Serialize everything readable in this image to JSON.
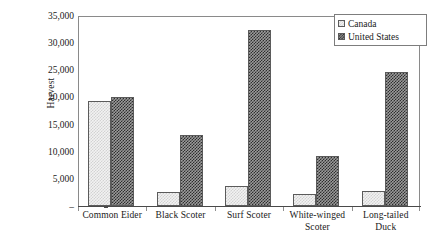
{
  "chart_data": {
    "type": "bar",
    "title": "",
    "xlabel": "",
    "ylabel": "Harvest",
    "ylim": [
      0,
      35000
    ],
    "ytick_values": [
      0,
      5000,
      10000,
      15000,
      20000,
      25000,
      30000,
      35000
    ],
    "ytick_labels": [
      "–",
      "5,000",
      "10,000",
      "15,000",
      "20,000",
      "25,000",
      "30,000",
      "35,000"
    ],
    "grid": false,
    "legend_position": "top-right",
    "categories": [
      "Common Eider",
      "Black Scoter",
      "Surf Scoter",
      "White-winged Scoter",
      "Long-tailed Duck"
    ],
    "category_label_lines": [
      [
        "Common Eider"
      ],
      [
        "Black Scoter"
      ],
      [
        "Surf Scoter"
      ],
      [
        "White-winged",
        "Scoter"
      ],
      [
        "Long-tailed",
        "Duck"
      ]
    ],
    "series": [
      {
        "name": "Canada",
        "pattern": "light-checkered",
        "color": "#f2f2f2",
        "values": [
          19200,
          2500,
          3700,
          2200,
          2800
        ]
      },
      {
        "name": "United States",
        "pattern": "dark-checkered",
        "color": "#2e2e2e",
        "values": [
          20000,
          13000,
          32200,
          9200,
          24500
        ]
      }
    ]
  },
  "legend": {
    "entries": [
      {
        "label": "Canada"
      },
      {
        "label": "United States"
      }
    ]
  },
  "colors": {
    "axis": "#4a4a4a",
    "frame": "#8a8a8a",
    "bar_outline": "#5b5b5b",
    "canada_fill": "#f2f2f2",
    "us_fill": "#2e2e2e"
  }
}
